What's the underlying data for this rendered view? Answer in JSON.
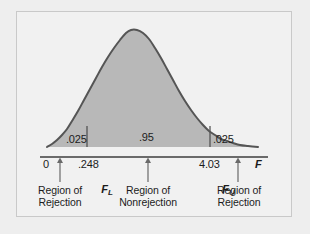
{
  "figure": {
    "background_color": "#eeeeee",
    "panel_color": "#f1f1f1",
    "frame_color": "#c9c9c9"
  },
  "chart_data": {
    "type": "area",
    "title": "",
    "subtitle": "",
    "xlabel": "F",
    "ylabel": "",
    "distribution": "F-distribution (right-skewed probability density)",
    "grid": false,
    "legend_position": "none",
    "curve_color": "#555555",
    "fill_color": "#b8b8b8",
    "xlim": [
      0,
      6
    ],
    "ylim": [
      0,
      1
    ],
    "x_ticks": [
      {
        "label": "0",
        "value": 0
      },
      {
        "label": ".248",
        "value": 0.248
      },
      {
        "label": "4.03",
        "value": 4.03
      },
      {
        "label": "F",
        "value": null
      }
    ],
    "critical_values": [
      {
        "name": "F_L",
        "symbol": "F",
        "subscript": "L",
        "label": ".248",
        "value": 0.248
      },
      {
        "name": "F_U",
        "symbol": "F",
        "subscript": "U",
        "label": "4.03",
        "value": 4.03
      }
    ],
    "regions": [
      {
        "id": "left-tail",
        "area_label": ".025",
        "area_value": 0.025,
        "caption_line1": "Region of",
        "caption_line2": "Rejection"
      },
      {
        "id": "center",
        "area_label": ".95",
        "area_value": 0.95,
        "caption_line1": "Region of",
        "caption_line2": "Nonrejection"
      },
      {
        "id": "right-tail",
        "area_label": ".025",
        "area_value": 0.025,
        "caption_line1": "Region of",
        "caption_line2": "Rejection"
      }
    ],
    "curve_points": [
      [
        47,
        147
      ],
      [
        52,
        144
      ],
      [
        57,
        140
      ],
      [
        62,
        135
      ],
      [
        67,
        129
      ],
      [
        72,
        121
      ],
      [
        78,
        111
      ],
      [
        84,
        100
      ],
      [
        90,
        89
      ],
      [
        96,
        78
      ],
      [
        102,
        67
      ],
      [
        108,
        57
      ],
      [
        114,
        48
      ],
      [
        120,
        40
      ],
      [
        126,
        33
      ],
      [
        131,
        30
      ],
      [
        137,
        30
      ],
      [
        143,
        33
      ],
      [
        149,
        39
      ],
      [
        155,
        48
      ],
      [
        161,
        58
      ],
      [
        167,
        69
      ],
      [
        173,
        80
      ],
      [
        179,
        91
      ],
      [
        185,
        101
      ],
      [
        191,
        110
      ],
      [
        197,
        118
      ],
      [
        203,
        125
      ],
      [
        209,
        131
      ],
      [
        215,
        135
      ],
      [
        221,
        139
      ],
      [
        227,
        141
      ],
      [
        233,
        143
      ],
      [
        240,
        145
      ],
      [
        248,
        146
      ],
      [
        258,
        147
      ]
    ]
  },
  "axis": {
    "baseline_label": "",
    "axis_symbol": "F"
  }
}
